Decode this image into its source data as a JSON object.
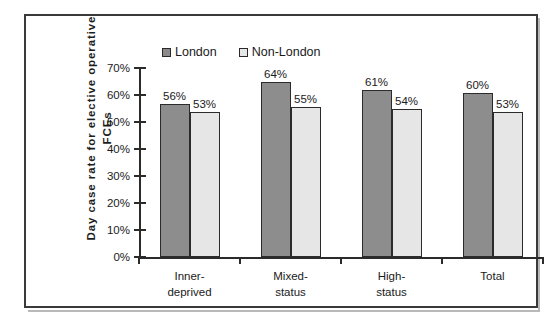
{
  "chart_data": {
    "type": "bar",
    "title": "",
    "xlabel": "",
    "ylabel": "Day case rate for elective operative FCEs",
    "ylabel_lines": [
      "Day case rate for elective operative",
      "FCEs"
    ],
    "categories": [
      "Inner-deprived",
      "Mixed-status",
      "High-status",
      "Total"
    ],
    "category_lines": [
      [
        "Inner-",
        "deprived"
      ],
      [
        "Mixed-",
        "status"
      ],
      [
        "High-",
        "status"
      ],
      [
        "Total",
        ""
      ]
    ],
    "series": [
      {
        "name": "London",
        "color": "#8d8d8d",
        "values": [
          56,
          64,
          61,
          60
        ],
        "labels": [
          "56%",
          "64%",
          "61%",
          "60%"
        ]
      },
      {
        "name": "Non-London",
        "color": "#e6e6e6",
        "values": [
          53,
          55,
          54,
          53
        ],
        "labels": [
          "53%",
          "55%",
          "54%",
          "53%"
        ]
      }
    ],
    "ylim": [
      0,
      70
    ],
    "y_ticks": [
      0,
      10,
      20,
      30,
      40,
      50,
      60,
      70
    ],
    "y_tick_labels": [
      "0%",
      "10%",
      "20%",
      "30%",
      "40%",
      "50%",
      "60%",
      "70%"
    ],
    "grid": false,
    "legend_position": "top-center",
    "value_suffix": "%"
  },
  "legend": {
    "items": [
      {
        "label": "London",
        "swatch": "london-swatch"
      },
      {
        "label": "Non-London",
        "swatch": "non-london-swatch"
      }
    ]
  },
  "colors": {
    "london": "#8d8d8d",
    "non_london": "#e6e6e6",
    "axis": "#2b2b2b",
    "frame": "#3a3a3a",
    "text": "#1a1a1a"
  }
}
